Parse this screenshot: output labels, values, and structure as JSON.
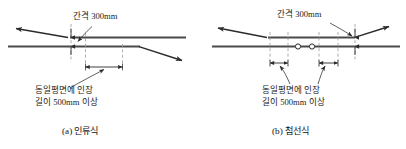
{
  "figure": {
    "title": "",
    "background_color": "#ffffff",
    "line_color": "#3a3a3a",
    "dash_color": "#8a8a8a",
    "text_color": "#1a1a1a",
    "panels": [
      {
        "id": "panel-a",
        "caption": "(a) 인류식",
        "gap_label": "간격 300mm",
        "note_line1": "동일평면에 인장",
        "note_line2": "길이 500mm 이상",
        "wires": 2,
        "insulator_count": 0
      },
      {
        "id": "panel-b",
        "caption": "(b) 첨선식",
        "gap_label": "간격 300mm",
        "note_line1": "동일평면에 인장",
        "note_line2": "길이 500mm 이상",
        "wires": 2,
        "insulator_count": 2
      }
    ]
  }
}
